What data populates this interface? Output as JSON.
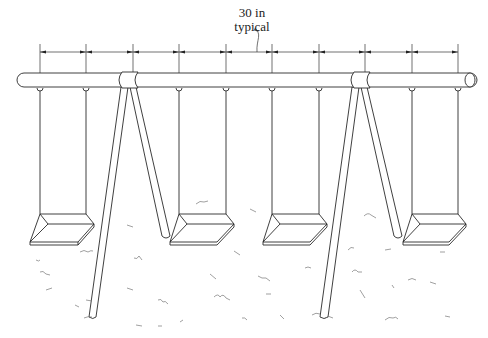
{
  "diagram": {
    "annotation": {
      "line1": "30 in",
      "line2": "typical"
    },
    "dimension": {
      "spacing_in": 30,
      "tick_x": [
        40,
        86,
        133,
        179,
        226,
        272,
        319,
        365,
        412,
        458
      ],
      "line_y": 52
    },
    "beam": {
      "x1": 18,
      "x2": 478,
      "y": 80,
      "height": 14
    },
    "seats": [
      {
        "name": "seat-1",
        "chain_left_x": 40,
        "chain_right_x": 86
      },
      {
        "name": "seat-2",
        "chain_left_x": 179,
        "chain_right_x": 226
      },
      {
        "name": "seat-3",
        "chain_left_x": 272,
        "chain_right_x": 319
      },
      {
        "name": "seat-4",
        "chain_left_x": 412,
        "chain_right_x": 458
      }
    ],
    "frames": [
      {
        "name": "a-frame-left",
        "top_x": 126
      },
      {
        "name": "a-frame-right",
        "top_x": 358
      }
    ],
    "colors": {
      "line": "#2a2a2a",
      "grass": "#777777",
      "background": "#ffffff"
    }
  }
}
